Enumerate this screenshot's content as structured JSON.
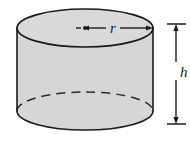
{
  "figure": {
    "kind": "cylinder-diagram",
    "labels": {
      "radius": "r",
      "height": "h"
    },
    "colors": {
      "body_fill": "#d6d6d6",
      "top_fill": "#d9d9d9",
      "outline": "#1a1a1a",
      "background": "#ffffff",
      "hidden_edge": "#2b2b2b"
    },
    "geometry": {
      "top_ellipse_center_x": 85,
      "top_ellipse_center_y": 28,
      "top_ellipse_rx": 68,
      "top_ellipse_ry": 19,
      "bottom_ellipse_center_y": 111,
      "bottom_ellipse_rx": 68,
      "bottom_ellipse_ry": 19,
      "left_wall_x": 17,
      "right_wall_x": 153,
      "dimension_line_x": 176,
      "dimension_top_y": 24,
      "dimension_bottom_y": 124
    },
    "annotations": [
      {
        "name": "radius-dimension",
        "label": "r",
        "style": "double-headed arrow from center dot to rim",
        "from_x": 85,
        "to_x": 152,
        "y": 28
      },
      {
        "name": "height-dimension",
        "label": "h",
        "style": "vertical double-headed arrow with end ticks",
        "x": 176,
        "from_y": 24,
        "to_y": 124
      }
    ]
  }
}
